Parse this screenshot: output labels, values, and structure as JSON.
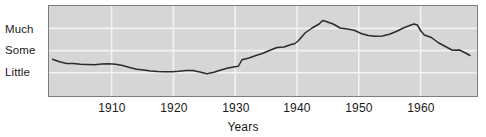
{
  "chart_data": {
    "type": "line",
    "title": "",
    "subtitle": "",
    "xlabel": "Years",
    "ylabel": "",
    "grid": true,
    "legend": null,
    "legend_position": "none",
    "background_color": "#d6d6d6",
    "line_color": "#2b2b2b",
    "grid_color": "#f2f2f2",
    "frame_color": "#7d7d7d",
    "xlim": [
      1904,
      1965
    ],
    "ylim": [
      0,
      3.6
    ],
    "xticks": [
      1910,
      1920,
      1930,
      1940,
      1950,
      1960
    ],
    "xtick_labels": [
      "1910",
      "1920",
      "1930",
      "1940",
      "1950",
      "1960"
    ],
    "yticks": [
      1,
      2,
      3
    ],
    "ytick_labels": [
      "Little",
      "Some",
      "Much"
    ],
    "series": [
      {
        "name": "amount",
        "x": [
          1904.5,
          1905.5,
          1906.5,
          1907.5,
          1908.5,
          1909.5,
          1910.5,
          1911.5,
          1912.5,
          1913.5,
          1914.5,
          1915.5,
          1916.5,
          1917.5,
          1918.5,
          1919.5,
          1920.5,
          1921.5,
          1922.5,
          1923.5,
          1924.5,
          1925.5,
          1926.5,
          1927.5,
          1928.5,
          1929.5,
          1930.5,
          1931.0,
          1931.5,
          1932.5,
          1933.5,
          1934.5,
          1935.5,
          1936.5,
          1937.5,
          1938.5,
          1939.0,
          1939.5,
          1940.5,
          1941.5,
          1942.5,
          1943.0,
          1943.5,
          1944.5,
          1945.5,
          1946.5,
          1947.5,
          1948.5,
          1949.5,
          1950.5,
          1951.5,
          1952.5,
          1953.5,
          1954.5,
          1955.5,
          1956.0,
          1956.5,
          1957.0,
          1957.5,
          1958.5,
          1959.5,
          1960.5,
          1961.5,
          1962.5,
          1963.5,
          1964.0
        ],
        "values": [
          1.47,
          1.37,
          1.3,
          1.3,
          1.27,
          1.26,
          1.25,
          1.28,
          1.29,
          1.27,
          1.22,
          1.14,
          1.07,
          1.04,
          1.0,
          0.98,
          0.97,
          0.97,
          0.99,
          1.02,
          1.02,
          0.96,
          0.89,
          0.95,
          1.04,
          1.12,
          1.17,
          1.19,
          1.45,
          1.52,
          1.62,
          1.71,
          1.83,
          1.94,
          1.96,
          2.06,
          2.09,
          2.2,
          2.52,
          2.72,
          2.88,
          3.02,
          2.98,
          2.88,
          2.72,
          2.68,
          2.63,
          2.5,
          2.42,
          2.39,
          2.4,
          2.47,
          2.58,
          2.72,
          2.83,
          2.88,
          2.84,
          2.6,
          2.44,
          2.34,
          2.13,
          1.98,
          1.83,
          1.84,
          1.7,
          1.62
        ]
      }
    ]
  },
  "axis": {
    "y_labels": [
      "Much",
      "Some",
      "Little"
    ],
    "x_labels": [
      "1910",
      "1920",
      "1930",
      "1940",
      "1950",
      "1960"
    ],
    "x_title": "Years"
  }
}
